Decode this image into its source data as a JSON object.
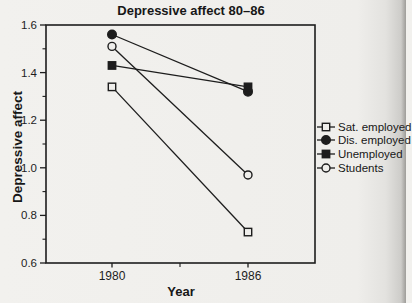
{
  "chart_data": {
    "type": "line",
    "title": "Depressive affect 80–86",
    "xlabel": "Year",
    "ylabel": "Depressive affect",
    "categories": [
      1980,
      1986
    ],
    "x_minor_ticks": [
      1983
    ],
    "ylim": [
      0.6,
      1.6
    ],
    "yticks": [
      1.6,
      1.4,
      1.2,
      1.0,
      0.8,
      0.6
    ],
    "y_minor_ticks": [
      1.5,
      1.3,
      1.1,
      0.9,
      0.7
    ],
    "grid": false,
    "legend_position": "right-outside",
    "series": [
      {
        "name": "Sat. employed",
        "marker": "open-square",
        "values": [
          1.34,
          0.73
        ]
      },
      {
        "name": "Dis. employed",
        "marker": "filled-circle",
        "values": [
          1.56,
          1.32
        ]
      },
      {
        "name": "Unemployed",
        "marker": "filled-square",
        "values": [
          1.43,
          1.34
        ]
      },
      {
        "name": "Students",
        "marker": "open-circle",
        "values": [
          1.51,
          0.97
        ]
      }
    ],
    "ink_color": "#1d1d1d",
    "background": "#efeeeb"
  }
}
